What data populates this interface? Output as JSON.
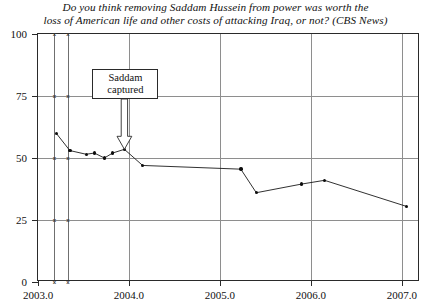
{
  "chart_data": {
    "type": "line",
    "title": "Do you think removing Saddam Hussein from power was worth the loss of American life and other costs of attacking Iraq, or not? (CBS News)",
    "title_lines": [
      "Do you think removing Saddam Hussein from power was worth the",
      "loss of American life and other costs of attacking Iraq, or not? (CBS News)"
    ],
    "xlabel": "",
    "ylabel": "",
    "xlim": [
      2003.0,
      2007.2
    ],
    "ylim": [
      0,
      100
    ],
    "grid": true,
    "legend": "none",
    "xticks": [
      2003.0,
      2004.0,
      2005.0,
      2006.0,
      2007.0
    ],
    "xticklabels": [
      "2003.0",
      "2004.0",
      "2005.0",
      "2006.0",
      "2007.0"
    ],
    "yticks": [
      0,
      25,
      50,
      75,
      100
    ],
    "yticklabels": [
      "0",
      "25",
      "50",
      "75",
      "100"
    ],
    "marker": "filled-circle",
    "line_color": "#1a1a1a",
    "marker_color": "#0d0d0d",
    "grid_color": "#8e8e8e",
    "frame_color": "#2a2a2a",
    "series": [
      {
        "name": "Worth it (%)",
        "x": [
          2003.2,
          2003.35,
          2003.53,
          2003.62,
          2003.73,
          2003.82,
          2003.95,
          2004.15,
          2005.23,
          2005.4,
          2005.9,
          2006.15,
          2007.05
        ],
        "y": [
          60.0,
          53.0,
          51.5,
          52.0,
          50.0,
          52.0,
          53.5,
          47.0,
          45.5,
          36.0,
          39.5,
          41.0,
          30.5
        ]
      }
    ],
    "aux_vlines": [
      2003.18,
      2003.33
    ],
    "aux_vline_markers": {
      "glyph": "x",
      "at_y": [
        0,
        25,
        50,
        75,
        100
      ]
    },
    "annotations": [
      {
        "label_lines": [
          "Saddam",
          "captured"
        ],
        "text": "Saddam captured",
        "points_to_x": 2003.95,
        "points_to_y": 53.5,
        "arrow_style": "hollow-down-arrow"
      }
    ]
  }
}
